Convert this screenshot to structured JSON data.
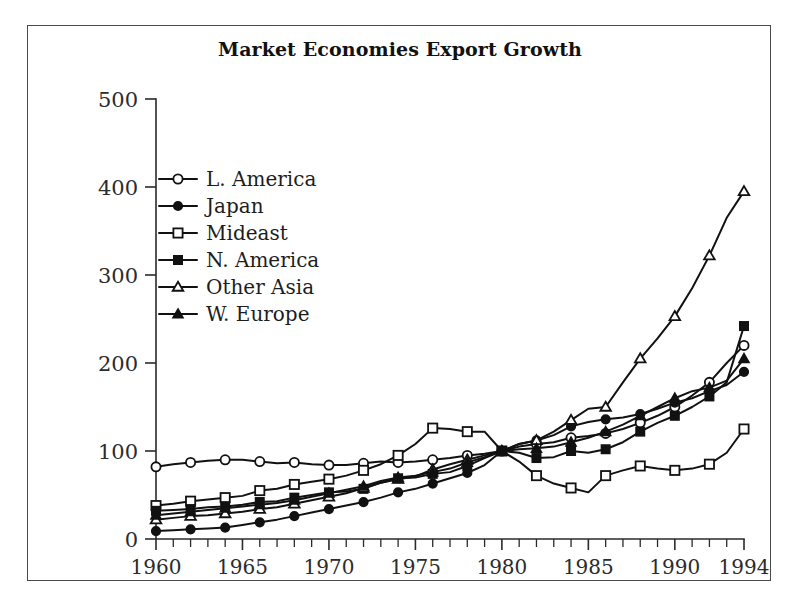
{
  "chart_data": {
    "type": "line",
    "title": "Market Economies Export Growth",
    "xlabel": "",
    "ylabel": "",
    "xlim": [
      1960,
      1994
    ],
    "ylim": [
      0,
      500
    ],
    "yticks": [
      0,
      100,
      200,
      300,
      400,
      500
    ],
    "xticks": [
      1960,
      1965,
      1970,
      1975,
      1980,
      1985,
      1990,
      1994
    ],
    "x_minor_tick_interval": 1,
    "grid": false,
    "legend_position": "upper-left-inside",
    "x": [
      1960,
      1961,
      1962,
      1963,
      1964,
      1965,
      1966,
      1967,
      1968,
      1969,
      1970,
      1971,
      1972,
      1973,
      1974,
      1975,
      1976,
      1977,
      1978,
      1979,
      1980,
      1981,
      1982,
      1983,
      1984,
      1985,
      1986,
      1987,
      1988,
      1989,
      1990,
      1991,
      1992,
      1993,
      1994
    ],
    "series": [
      {
        "name": "L. America",
        "marker": "open-circle",
        "values": [
          82,
          85,
          87,
          89,
          90,
          90,
          88,
          86,
          87,
          85,
          84,
          84,
          86,
          88,
          87,
          88,
          90,
          92,
          95,
          97,
          100,
          105,
          108,
          110,
          115,
          117,
          120,
          125,
          132,
          140,
          150,
          163,
          178,
          200,
          220
        ]
      },
      {
        "name": "Japan",
        "marker": "filled-circle",
        "values": [
          9,
          10,
          11,
          12,
          13,
          16,
          19,
          22,
          26,
          30,
          34,
          38,
          42,
          47,
          53,
          57,
          63,
          69,
          75,
          84,
          100,
          108,
          112,
          118,
          128,
          133,
          136,
          138,
          142,
          148,
          155,
          160,
          168,
          175,
          190
        ]
      },
      {
        "name": "Mideast",
        "marker": "open-square",
        "values": [
          38,
          40,
          43,
          45,
          47,
          49,
          55,
          57,
          62,
          65,
          68,
          72,
          78,
          85,
          95,
          108,
          126,
          125,
          122,
          122,
          100,
          88,
          72,
          63,
          58,
          53,
          72,
          78,
          83,
          80,
          78,
          80,
          85,
          98,
          125
        ]
      },
      {
        "name": "N. America",
        "marker": "filled-square",
        "values": [
          32,
          33,
          34,
          36,
          37,
          39,
          42,
          43,
          47,
          50,
          53,
          54,
          57,
          64,
          69,
          70,
          74,
          76,
          83,
          92,
          100,
          98,
          92,
          93,
          100,
          98,
          102,
          110,
          122,
          132,
          140,
          150,
          162,
          178,
          242
        ]
      },
      {
        "name": "Other Asia",
        "marker": "open-triangle",
        "values": [
          22,
          24,
          26,
          27,
          29,
          31,
          34,
          36,
          40,
          44,
          48,
          52,
          58,
          64,
          68,
          71,
          79,
          85,
          90,
          95,
          100,
          108,
          112,
          122,
          135,
          148,
          150,
          178,
          205,
          228,
          253,
          285,
          322,
          365,
          395
        ]
      },
      {
        "name": "W. Europe",
        "marker": "filled-triangle",
        "values": [
          27,
          29,
          31,
          33,
          35,
          37,
          39,
          41,
          44,
          48,
          52,
          56,
          60,
          66,
          70,
          72,
          76,
          80,
          87,
          93,
          100,
          102,
          103,
          105,
          110,
          115,
          122,
          130,
          140,
          150,
          160,
          168,
          172,
          180,
          205
        ]
      }
    ]
  },
  "legend": {
    "entries": [
      {
        "label": "L. America",
        "marker": "open-circle"
      },
      {
        "label": "Japan",
        "marker": "filled-circle"
      },
      {
        "label": "Mideast",
        "marker": "open-square"
      },
      {
        "label": "N. America",
        "marker": "filled-square"
      },
      {
        "label": "Other Asia",
        "marker": "open-triangle"
      },
      {
        "label": "W. Europe",
        "marker": "filled-triangle"
      }
    ]
  },
  "colors": {
    "line": "#111111",
    "axis": "#2a2a2a",
    "frame": "#4a4a4a",
    "background": "#ffffff",
    "text": "#1d1d1d"
  }
}
